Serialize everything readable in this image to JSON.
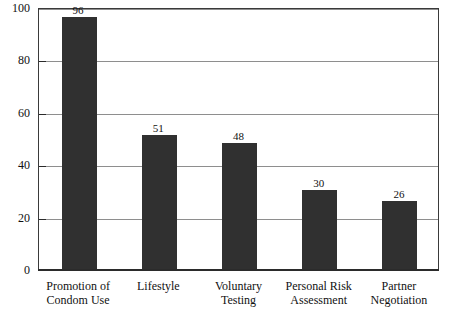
{
  "chart_data": {
    "type": "bar",
    "title": "",
    "subtitle": "",
    "xlabel": "",
    "ylabel": "",
    "ylim": [
      0,
      100
    ],
    "yticks": [
      0,
      20,
      40,
      60,
      80,
      100
    ],
    "ytick_labels": [
      "0",
      "20",
      "40",
      "60",
      "80",
      "100"
    ],
    "grid": true,
    "legend": null,
    "bar_color": "#303030",
    "categories": [
      "Promotion of Condom Use",
      "Lifestyle",
      "Voluntary Testing",
      "Personal Risk Assessment",
      "Partner Negotiation"
    ],
    "category_lines": [
      [
        "Promotion of",
        "Condom Use"
      ],
      [
        "Lifestyle",
        ""
      ],
      [
        "Voluntary",
        "Testing"
      ],
      [
        "Personal Risk",
        "Assessment"
      ],
      [
        "Partner",
        "Negotiation"
      ]
    ],
    "values": [
      96,
      51,
      48,
      30,
      26
    ],
    "value_labels": [
      "96",
      "51",
      "48",
      "30",
      "26"
    ]
  }
}
